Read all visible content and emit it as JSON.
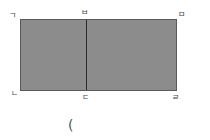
{
  "diagram": {
    "shape": "rectangle divided into two parts",
    "fill_color": "#8c8c8c",
    "labels": {
      "top_left": "ㄱ",
      "top_middle": "ㅂ",
      "top_right": "ㅁ",
      "bottom_left": "ㄴ",
      "bottom_middle": "ㄷ",
      "bottom_right": "ㄹ"
    },
    "answer_paren": "("
  }
}
